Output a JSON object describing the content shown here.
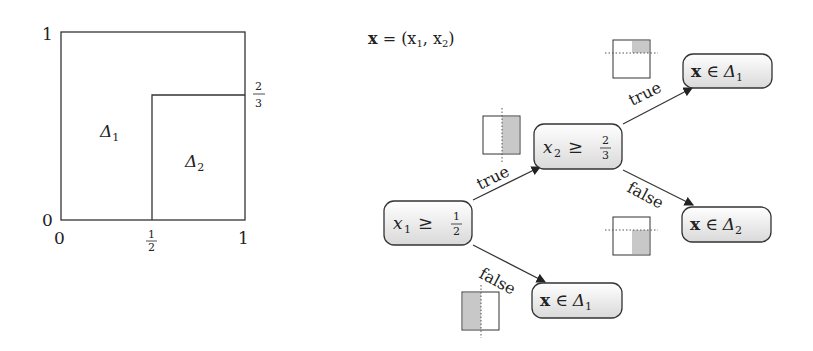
{
  "partition_plot": {
    "y_ticks": {
      "top": "1",
      "bottom": "0"
    },
    "x_ticks": {
      "left": "0",
      "mid_num": "1",
      "mid_den": "2",
      "right": "1"
    },
    "right_tick": {
      "num": "2",
      "den": "3"
    },
    "regions": [
      {
        "symbol": "Δ",
        "sub": "1"
      },
      {
        "symbol": "Δ",
        "sub": "2"
      }
    ]
  },
  "tree": {
    "definition": {
      "lhs": "x",
      "rhs": " = (x",
      "s1": "1",
      "mid": ", x",
      "s2": "2",
      "end": ")"
    },
    "root": {
      "var": "x",
      "sub": "1",
      "op": "≥",
      "num": "1",
      "den": "2"
    },
    "inner": {
      "var": "x",
      "sub": "2",
      "op": "≥",
      "num": "2",
      "den": "3"
    },
    "leaves": [
      {
        "x": "x",
        "op": "∈",
        "set": "Δ",
        "sub": "1"
      },
      {
        "x": "x",
        "op": "∈",
        "set": "Δ",
        "sub": "2"
      },
      {
        "x": "x",
        "op": "∈",
        "set": "Δ",
        "sub": "1"
      }
    ],
    "edge_labels": {
      "true": "true",
      "false": "false"
    }
  }
}
